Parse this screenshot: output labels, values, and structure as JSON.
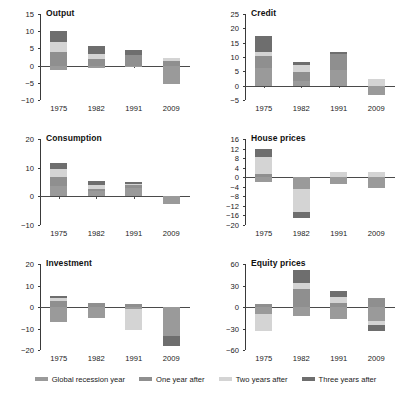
{
  "figure": {
    "width": 411,
    "height": 393,
    "background": "#ffffff"
  },
  "legend": {
    "position": "bottom-center",
    "items": [
      {
        "label": "Global recession year",
        "color": "#9a9a9a",
        "key": "global-recession-year"
      },
      {
        "label": "One year after",
        "color": "#8f8f8f",
        "key": "one-year-after"
      },
      {
        "label": "Two years after",
        "color": "#d4d4d4",
        "key": "two-years-after"
      },
      {
        "label": "Three years after",
        "color": "#6e6e6e",
        "key": "three-years-after"
      }
    ]
  },
  "chart_data": [
    {
      "type": "bar",
      "title": "Output",
      "stacked": true,
      "xlabel": "",
      "ylabel": "",
      "grid": false,
      "categories": [
        "1975",
        "1982",
        "1991",
        "2009"
      ],
      "yticks": [
        15,
        10,
        5,
        0,
        -5,
        -10
      ],
      "ylim": [
        -10,
        15
      ],
      "series": [
        {
          "name": "Global recession year",
          "color": "#9a9a9a",
          "values": [
            -1.2,
            -0.6,
            -0.5,
            -5.3
          ]
        },
        {
          "name": "One year after",
          "color": "#8f8f8f",
          "values": [
            3.9,
            1.9,
            3.0,
            1.3
          ]
        },
        {
          "name": "Two years after",
          "color": "#d4d4d4",
          "values": [
            2.9,
            1.4,
            0.0,
            1.0
          ]
        },
        {
          "name": "Three years after",
          "color": "#6e6e6e",
          "values": [
            3.2,
            2.4,
            1.4,
            0.0
          ]
        }
      ]
    },
    {
      "type": "bar",
      "title": "Credit",
      "stacked": true,
      "xlabel": "",
      "ylabel": "",
      "grid": false,
      "categories": [
        "1975",
        "1982",
        "1991",
        "2009"
      ],
      "yticks": [
        25,
        20,
        15,
        10,
        5,
        0,
        -5
      ],
      "ylim": [
        -5,
        25
      ],
      "series": [
        {
          "name": "Global recession year",
          "color": "#9a9a9a",
          "values": [
            6.2,
            1.6,
            5.4,
            -3.2
          ]
        },
        {
          "name": "One year after",
          "color": "#8f8f8f",
          "values": [
            4.0,
            3.2,
            5.8,
            0.0
          ]
        },
        {
          "name": "Two years after",
          "color": "#d4d4d4",
          "values": [
            1.7,
            2.5,
            0.0,
            2.5
          ]
        },
        {
          "name": "Three years after",
          "color": "#6e6e6e",
          "values": [
            5.3,
            1.0,
            0.5,
            0.0
          ]
        }
      ]
    },
    {
      "type": "bar",
      "title": "Consumption",
      "stacked": true,
      "xlabel": "",
      "ylabel": "",
      "grid": false,
      "categories": [
        "1975",
        "1982",
        "1991",
        "2009"
      ],
      "yticks": [
        20,
        10,
        0,
        -10
      ],
      "ylim": [
        -10,
        20
      ],
      "series": [
        {
          "name": "Global recession year",
          "color": "#9a9a9a",
          "values": [
            3.6,
            1.9,
            3.0,
            -2.6
          ]
        },
        {
          "name": "One year after",
          "color": "#8f8f8f",
          "values": [
            3.2,
            0.8,
            0.8,
            0.0
          ]
        },
        {
          "name": "Two years after",
          "color": "#d4d4d4",
          "values": [
            2.6,
            1.2,
            0.5,
            0.0
          ]
        },
        {
          "name": "Three years after",
          "color": "#6e6e6e",
          "values": [
            2.2,
            1.3,
            0.8,
            0.0
          ]
        }
      ]
    },
    {
      "type": "bar",
      "title": "House prices",
      "stacked": true,
      "xlabel": "",
      "ylabel": "",
      "grid": false,
      "categories": [
        "1975",
        "1982",
        "1991",
        "2009"
      ],
      "yticks": [
        16,
        12,
        8,
        4,
        0,
        -4,
        -8,
        -12,
        -16,
        -20
      ],
      "ylim": [
        -20,
        16
      ],
      "series": [
        {
          "name": "Global recession year",
          "color": "#9a9a9a",
          "values": [
            -2.0,
            -5.0,
            -3.0,
            -4.5
          ]
        },
        {
          "name": "One year after",
          "color": "#8f8f8f",
          "values": [
            1.5,
            0.0,
            0.0,
            0.0
          ]
        },
        {
          "name": "Two years after",
          "color": "#d4d4d4",
          "values": [
            7.0,
            -9.5,
            2.0,
            2.0
          ]
        },
        {
          "name": "Three years after",
          "color": "#6e6e6e",
          "values": [
            3.2,
            -2.5,
            0.0,
            0.0
          ]
        }
      ]
    },
    {
      "type": "bar",
      "title": "Investment",
      "stacked": true,
      "xlabel": "",
      "ylabel": "",
      "grid": false,
      "categories": [
        "1975",
        "1982",
        "1991",
        "2009"
      ],
      "yticks": [
        20,
        10,
        0,
        -10,
        -20
      ],
      "ylim": [
        -20,
        20
      ],
      "series": [
        {
          "name": "Global recession year",
          "color": "#9a9a9a",
          "values": [
            -7.0,
            -5.0,
            -1.0,
            -13.5
          ]
        },
        {
          "name": "One year after",
          "color": "#8f8f8f",
          "values": [
            2.9,
            1.7,
            1.4,
            0.0
          ]
        },
        {
          "name": "Two years after",
          "color": "#d4d4d4",
          "values": [
            1.2,
            0.0,
            -9.5,
            0.0
          ]
        },
        {
          "name": "Three years after",
          "color": "#6e6e6e",
          "values": [
            0.9,
            0.0,
            0.0,
            -4.5
          ]
        }
      ]
    },
    {
      "type": "bar",
      "title": "Equity prices",
      "stacked": true,
      "xlabel": "",
      "ylabel": "",
      "grid": false,
      "categories": [
        "1975",
        "1982",
        "1991",
        "2009"
      ],
      "yticks": [
        60,
        30,
        0,
        -30,
        -60
      ],
      "ylim": [
        -60,
        60
      ],
      "series": [
        {
          "name": "Global recession year",
          "color": "#9a9a9a",
          "values": [
            -10.0,
            -12.0,
            -17.0,
            -20.0
          ]
        },
        {
          "name": "One year after",
          "color": "#8f8f8f",
          "values": [
            3.5,
            25.0,
            5.0,
            12.0
          ]
        },
        {
          "name": "Two years after",
          "color": "#d4d4d4",
          "values": [
            -23.0,
            9.0,
            9.0,
            -5.0
          ]
        },
        {
          "name": "Three years after",
          "color": "#6e6e6e",
          "values": [
            0.0,
            18.0,
            8.0,
            -9.0
          ]
        }
      ]
    }
  ]
}
